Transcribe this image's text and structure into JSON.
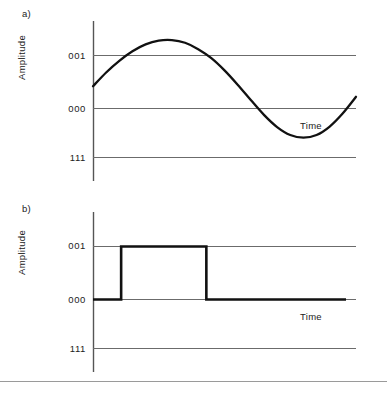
{
  "figure": {
    "width": 387,
    "height": 394,
    "background": "#ffffff",
    "line_color_axis": "#555555",
    "line_color_grid": "#6b6b6b",
    "line_color_signal": "#111111",
    "divider_color": "#9a9a9a"
  },
  "panels": [
    {
      "id": "a",
      "label": "a)",
      "y_axis_title": "Amplitude",
      "x_axis_title": "Time",
      "tick_labels": [
        "001",
        "000",
        "111"
      ],
      "signal_type": "sine"
    },
    {
      "id": "b",
      "label": "b)",
      "y_axis_title": "Amplitude",
      "x_axis_title": "Time",
      "tick_labels": [
        "001",
        "000",
        "111"
      ],
      "signal_type": "square"
    }
  ],
  "chart_data": [
    {
      "type": "line",
      "title": "a)",
      "xlabel": "Time",
      "ylabel": "Amplitude",
      "ytick_labels": [
        "001",
        "000",
        "111"
      ],
      "ytick_values": [
        1,
        0,
        -1
      ],
      "ylim": [
        -1.6,
        1.6
      ],
      "xlim": [
        0,
        1
      ],
      "grid": true,
      "legend": "none",
      "series": [
        {
          "name": "analog-sine",
          "description": "continuous sine wave starting mid-rise, one full cycle, ending rising",
          "x": [
            0.0,
            0.05,
            0.1,
            0.15,
            0.2,
            0.25,
            0.3,
            0.35,
            0.4,
            0.45,
            0.5,
            0.55,
            0.6,
            0.65,
            0.7,
            0.75,
            0.8,
            0.85,
            0.9,
            0.95,
            1.0
          ],
          "values": [
            0.42,
            0.68,
            0.9,
            1.08,
            1.21,
            1.28,
            1.29,
            1.24,
            1.12,
            0.95,
            0.72,
            0.45,
            0.16,
            -0.12,
            -0.35,
            -0.5,
            -0.55,
            -0.5,
            -0.34,
            -0.09,
            0.22
          ]
        }
      ]
    },
    {
      "type": "line",
      "title": "b)",
      "xlabel": "Time",
      "ylabel": "Amplitude",
      "ytick_labels": [
        "001",
        "000",
        "111"
      ],
      "ytick_values": [
        1,
        0,
        -1
      ],
      "ylim": [
        -1.6,
        1.6
      ],
      "xlim": [
        0,
        1
      ],
      "grid": true,
      "legend": "none",
      "series": [
        {
          "name": "digital-square",
          "description": "digital step signal: low, one high pulse, then low",
          "x": [
            0.0,
            0.107,
            0.107,
            0.431,
            0.431,
            0.962
          ],
          "values": [
            0,
            0,
            1,
            1,
            0,
            0
          ]
        }
      ]
    }
  ]
}
